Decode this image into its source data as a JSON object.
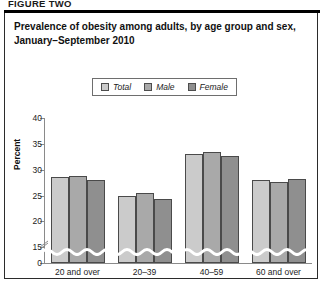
{
  "figure": {
    "label": "FIGURE TWO",
    "title": "Prevalence of obesity among adults, by age group and sex, January–September 2010"
  },
  "legend": {
    "position": "top-center",
    "items": [
      {
        "label": "Total",
        "color": "#cbcbcb"
      },
      {
        "label": "Male",
        "color": "#a9a9a9"
      },
      {
        "label": "Female",
        "color": "#8f8f8f"
      }
    ]
  },
  "axis": {
    "ylabel": "Percent",
    "yticks": [
      "0",
      "15",
      "20",
      "25",
      "30",
      "35",
      "40"
    ],
    "break_note": "axis break between 0 and 15"
  },
  "chart_data": {
    "type": "bar",
    "title": "Prevalence of obesity among adults, by age group and sex, January–September 2010",
    "xlabel": "",
    "ylabel": "Percent",
    "ylim": [
      0,
      40
    ],
    "yticks": [
      0,
      15,
      20,
      25,
      30,
      35,
      40
    ],
    "axis_break": [
      0,
      15
    ],
    "grid": false,
    "legend_position": "top-center",
    "categories": [
      "20 and over",
      "20–39",
      "40–59",
      "60 and over"
    ],
    "series": [
      {
        "name": "Total",
        "color": "#cbcbcb",
        "values": [
          28.5,
          25.0,
          33.0,
          28.0
        ]
      },
      {
        "name": "Male",
        "color": "#a9a9a9",
        "values": [
          28.8,
          25.5,
          33.4,
          27.6
        ]
      },
      {
        "name": "Female",
        "color": "#8f8f8f",
        "values": [
          28.1,
          24.4,
          32.7,
          28.2
        ]
      }
    ]
  }
}
